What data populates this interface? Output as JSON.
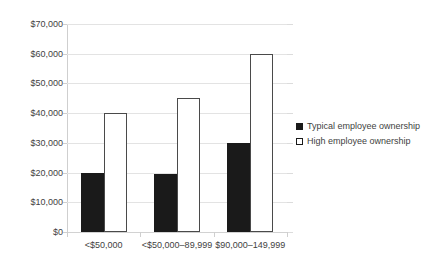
{
  "chart_data": {
    "type": "bar",
    "title": "",
    "subtitle": "",
    "xlabel": "",
    "ylabel": "",
    "categories": [
      "<$50,000",
      "<$50,000–89,999",
      "$90,000–149,999"
    ],
    "series": [
      {
        "name": "Typical employee ownership",
        "values": [
          20000,
          19500,
          30000
        ],
        "fill": "#1a1a1a",
        "stroke": "#1a1a1a"
      },
      {
        "name": "High employee ownership",
        "values": [
          40000,
          45000,
          60000
        ],
        "fill": "#ffffff",
        "stroke": "#4a4a4a"
      }
    ],
    "ylim": [
      0,
      70000
    ],
    "ytick_values": [
      0,
      10000,
      20000,
      30000,
      40000,
      50000,
      60000,
      70000
    ],
    "ytick_labels": [
      "$0",
      "$10,000",
      "$20,000",
      "$30,000",
      "$40,000",
      "$50,000",
      "$60,000",
      "$70,000"
    ],
    "grid": true,
    "legend_position": "right"
  },
  "legend": {
    "items": [
      {
        "label": "Typical employee ownership",
        "marker": "filled-square-marker"
      },
      {
        "label": "High employee ownership",
        "marker": "outlined-square-marker"
      }
    ]
  },
  "colors": {
    "typical": "#1a1a1a",
    "high_fill": "#ffffff",
    "high_stroke": "#4a4a4a",
    "gridline": "#e3e3e3",
    "axis": "#cfcfcf",
    "text": "#3f3f3f",
    "background": "#ffffff"
  }
}
